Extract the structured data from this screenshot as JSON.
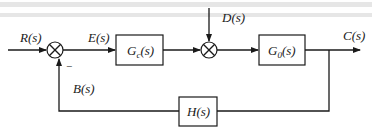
{
  "diagram": {
    "type": "feedback-control-block-diagram",
    "signals": {
      "input": "R(s)",
      "error": "E(s)",
      "disturbance": "D(s)",
      "output": "C(s)",
      "feedback": "B(s)"
    },
    "blocks": {
      "controller": {
        "main": "G",
        "sub": "c",
        "tail": "(s)"
      },
      "plant": {
        "main": "G",
        "sub": "0",
        "tail": "(s)"
      },
      "feedback": {
        "label": "H(s)"
      }
    },
    "summing_junctions": {
      "input_sum": {
        "feedback_sign": "−"
      },
      "disturbance_sum": {}
    },
    "colors": {
      "line": "#1a1a1a",
      "background": "#ffffff"
    }
  }
}
